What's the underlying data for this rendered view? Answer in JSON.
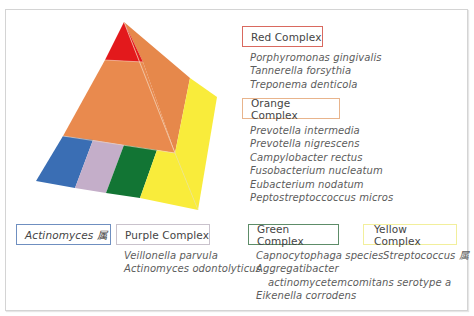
{
  "diagram": {
    "type": "pyramid",
    "layers": [
      {
        "name": "red",
        "color": "#e3191c"
      },
      {
        "name": "orange",
        "color": "#e98a4e"
      },
      {
        "name": "yellow",
        "color": "#f9ec3b"
      },
      {
        "name": "blue",
        "color": "#3a6eb4"
      },
      {
        "name": "purple",
        "color": "#c4aec9"
      },
      {
        "name": "green",
        "color": "#127534"
      }
    ]
  },
  "complexes": {
    "red": {
      "label": "Red Complex",
      "border_color": "#d9695f",
      "species": [
        "Porphyromonas gingivalis",
        "Tannerella forsythia",
        "Treponema denticola"
      ]
    },
    "orange": {
      "label": "Orange Complex",
      "border_color": "#e8b48c",
      "species": [
        "Prevotella intermedia",
        "Prevotella nigrescens",
        "Campylobacter rectus",
        "Fusobacterium nucleatum",
        "Eubacterium nodatum",
        "Peptostreptoccoccus micros"
      ]
    },
    "actinomyces": {
      "label": "Actinomyces 属",
      "border_color": "#6f8fc0"
    },
    "purple": {
      "label": "Purple Complex",
      "border_color": "#c9c2cc",
      "species": [
        "Veillonella parvula",
        "Actinomyces odontolyticus"
      ]
    },
    "green": {
      "label": "Green Complex",
      "border_color": "#5d8c68",
      "species": [
        "Capnocytophaga species",
        "Aggregatibacter",
        "actinomycetemcomitans serotype a",
        "Eikenella corrodens"
      ]
    },
    "yellow": {
      "label": "Yellow Complex",
      "border_color": "#f2ef9c",
      "species": [
        "Streptococcus 属"
      ]
    }
  }
}
